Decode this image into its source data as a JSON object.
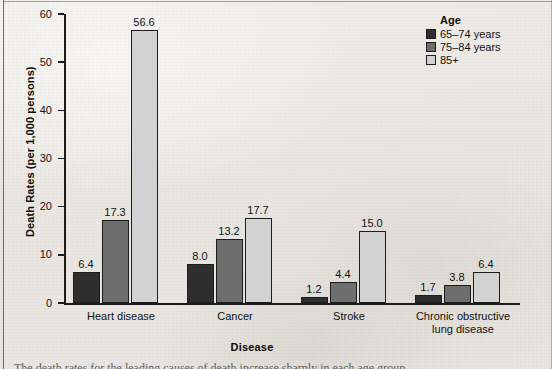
{
  "chart_data": {
    "type": "bar",
    "title": "",
    "xlabel": "Disease",
    "ylabel": "Death Rates (per 1,000 persons)",
    "ylim": [
      0,
      60
    ],
    "yticks": [
      0,
      10,
      20,
      30,
      40,
      50,
      60
    ],
    "grid": false,
    "legend_position": "top-right",
    "legend_title": "Age",
    "categories": [
      "Heart disease",
      "Cancer",
      "Stroke",
      "Chronic obstructive lung disease"
    ],
    "series": [
      {
        "name": "65–74 years",
        "color": "#2e2e2e",
        "values": [
          6.4,
          8.0,
          1.2,
          1.7
        ]
      },
      {
        "name": "75–84 years",
        "color": "#6e6e6e",
        "values": [
          17.3,
          13.2,
          4.4,
          3.8
        ]
      },
      {
        "name": "85+",
        "color": "#d2d2d2",
        "values": [
          56.6,
          17.7,
          15.0,
          6.4
        ]
      }
    ],
    "data_labels": [
      [
        "6.4",
        "17.3",
        "56.6"
      ],
      [
        "8.0",
        "13.2",
        "17.7"
      ],
      [
        "1.2",
        "4.4",
        "15.0"
      ],
      [
        "1.7",
        "3.8",
        "6.4"
      ]
    ],
    "category_display": [
      "Heart disease",
      "Cancer",
      "Stroke",
      "Chronic obstructive\nlung disease"
    ]
  },
  "axis": {
    "y_tick_labels": [
      "60",
      "50",
      "40",
      "30",
      "20",
      "10",
      "0"
    ],
    "y_title": "Death Rates (per 1,000 persons)",
    "x_title": "Disease"
  },
  "legend": {
    "title": "Age",
    "items": [
      {
        "label": "65–74 years",
        "color": "#2e2e2e"
      },
      {
        "label": "75–84 years",
        "color": "#6e6e6e"
      },
      {
        "label": "85+",
        "color": "#d2d2d2"
      }
    ]
  },
  "caption": {
    "text": "The death rates for the leading causes of death increase sharply in each age group"
  }
}
